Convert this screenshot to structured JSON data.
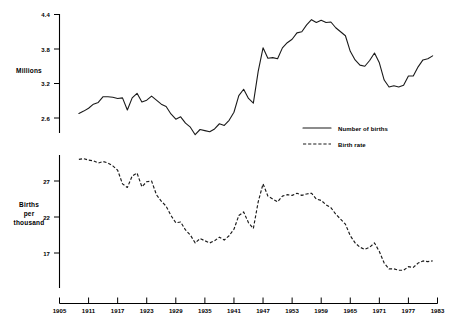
{
  "chart_data": {
    "type": "line",
    "title": "",
    "subtitle": "",
    "panels": [
      {
        "id": "births-panel",
        "ylabel": "Millions",
        "ylim": [
          2.2,
          4.55
        ],
        "yticks": [
          2.6,
          3.2,
          3.8,
          4.4
        ],
        "ytick_labels": [
          "2.6",
          "3.2",
          "3.8",
          "4.4"
        ],
        "grid": false,
        "series": [
          {
            "name": "Number of births",
            "style": "solid",
            "x": [
              1909,
              1910,
              1911,
              1912,
              1913,
              1914,
              1915,
              1916,
              1917,
              1918,
              1919,
              1920,
              1921,
              1922,
              1923,
              1924,
              1925,
              1926,
              1927,
              1928,
              1929,
              1930,
              1931,
              1932,
              1933,
              1934,
              1935,
              1936,
              1937,
              1938,
              1939,
              1940,
              1941,
              1942,
              1943,
              1944,
              1945,
              1946,
              1947,
              1948,
              1949,
              1950,
              1951,
              1952,
              1953,
              1954,
              1955,
              1956,
              1957,
              1958,
              1959,
              1960,
              1961,
              1962,
              1963,
              1964,
              1965,
              1966,
              1967,
              1968,
              1969,
              1970,
              1971,
              1972,
              1973,
              1974,
              1975,
              1976,
              1977,
              1978,
              1979,
              1980,
              1981,
              1982
            ],
            "values": [
              2.68,
              2.72,
              2.77,
              2.84,
              2.87,
              2.97,
              2.97,
              2.96,
              2.94,
              2.95,
              2.74,
              2.95,
              3.03,
              2.88,
              2.91,
              2.98,
              2.91,
              2.84,
              2.8,
              2.67,
              2.58,
              2.62,
              2.51,
              2.44,
              2.31,
              2.4,
              2.38,
              2.36,
              2.41,
              2.5,
              2.47,
              2.56,
              2.7,
              2.99,
              3.1,
              2.94,
              2.86,
              3.41,
              3.82,
              3.64,
              3.65,
              3.63,
              3.82,
              3.91,
              3.97,
              4.08,
              4.1,
              4.22,
              4.31,
              4.26,
              4.3,
              4.26,
              4.27,
              4.17,
              4.1,
              4.03,
              3.76,
              3.61,
              3.52,
              3.5,
              3.6,
              3.73,
              3.56,
              3.26,
              3.14,
              3.16,
              3.14,
              3.17,
              3.33,
              3.33,
              3.49,
              3.61,
              3.63,
              3.68
            ]
          }
        ]
      },
      {
        "id": "rate-panel",
        "ylabel": "Births per thousand",
        "ylabel_lines": [
          "Births",
          "per",
          "thousand"
        ],
        "ylim": [
          12.0,
          31.5
        ],
        "yticks": [
          17,
          22,
          27
        ],
        "ytick_labels": [
          "17",
          "22",
          "27"
        ],
        "grid": false,
        "series": [
          {
            "name": "Birth rate",
            "style": "dashed",
            "x": [
              1909,
              1910,
              1911,
              1912,
              1913,
              1914,
              1915,
              1916,
              1917,
              1918,
              1919,
              1920,
              1921,
              1922,
              1923,
              1924,
              1925,
              1926,
              1927,
              1928,
              1929,
              1930,
              1931,
              1932,
              1933,
              1934,
              1935,
              1936,
              1937,
              1938,
              1939,
              1940,
              1941,
              1942,
              1943,
              1944,
              1945,
              1946,
              1947,
              1948,
              1949,
              1950,
              1951,
              1952,
              1953,
              1954,
              1955,
              1956,
              1957,
              1958,
              1959,
              1960,
              1961,
              1962,
              1963,
              1964,
              1965,
              1966,
              1967,
              1968,
              1969,
              1970,
              1971,
              1972,
              1973,
              1974,
              1975,
              1976,
              1977,
              1978,
              1979,
              1980,
              1981,
              1982
            ],
            "values": [
              30.0,
              30.1,
              29.9,
              29.8,
              29.5,
              29.7,
              29.5,
              29.1,
              28.5,
              26.6,
              26.1,
              27.7,
              28.1,
              26.2,
              26.9,
              27.0,
              25.1,
              24.2,
              23.5,
              22.2,
              21.2,
              21.3,
              20.2,
              19.5,
              18.4,
              19.0,
              18.7,
              18.4,
              18.7,
              19.2,
              18.8,
              19.4,
              20.3,
              22.2,
              22.7,
              21.2,
              20.4,
              24.1,
              26.6,
              24.9,
              24.5,
              24.1,
              24.9,
              25.1,
              25.0,
              25.3,
              25.0,
              25.2,
              25.3,
              24.5,
              24.3,
              23.7,
              23.3,
              22.4,
              21.7,
              21.0,
              19.4,
              18.4,
              17.8,
              17.5,
              17.8,
              18.4,
              17.2,
              15.6,
              14.8,
              14.8,
              14.6,
              14.6,
              15.1,
              15.0,
              15.6,
              15.9,
              15.8,
              15.9
            ]
          }
        ]
      }
    ],
    "xlabel": "",
    "xlim": [
      1905,
      1983
    ],
    "xticks": [
      1905,
      1911,
      1917,
      1923,
      1929,
      1935,
      1941,
      1947,
      1953,
      1959,
      1965,
      1971,
      1977,
      1983
    ],
    "xtick_labels": [
      "1905",
      "1911",
      "1917",
      "1923",
      "1929",
      "1935",
      "1941",
      "1947",
      "1953",
      "1959",
      "1965",
      "1971",
      "1977",
      "1983"
    ],
    "legend": {
      "position": "center-right",
      "entries": [
        {
          "label": "Number of births",
          "style": "solid"
        },
        {
          "label": "Birth rate",
          "style": "dashed"
        }
      ]
    },
    "colors": {
      "line": "#1a1a1a",
      "axis": "#000000",
      "background": "#ffffff"
    }
  }
}
